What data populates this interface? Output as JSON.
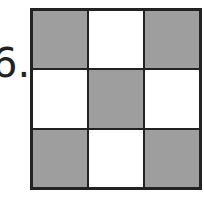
{
  "label": "6.",
  "grid": {
    "rows": 3,
    "cols": 3,
    "shaded_color": "#9e9e9e",
    "empty_color": "#ffffff",
    "cells": [
      [
        "shaded",
        "empty",
        "shaded"
      ],
      [
        "empty",
        "shaded",
        "empty"
      ],
      [
        "shaded",
        "empty",
        "shaded"
      ]
    ]
  }
}
